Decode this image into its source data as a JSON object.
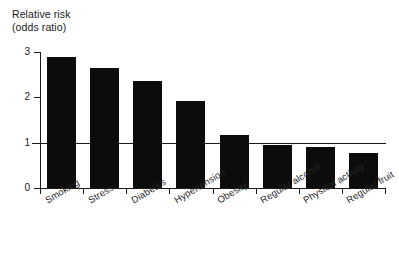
{
  "chart_data": {
    "type": "bar",
    "title": "",
    "ylabel": "Relative risk (odds ratio)",
    "ylabel_lines": [
      "Relative risk",
      "(odds ratio)"
    ],
    "xlabel": "",
    "categories": [
      "Smoking",
      "Stress",
      "Diabetes",
      "Hypertension",
      "Obesity",
      "Regular alcohol",
      "Physical activity",
      "Regular fruit"
    ],
    "values": [
      2.88,
      2.65,
      2.37,
      1.93,
      1.17,
      0.95,
      0.91,
      0.77
    ],
    "ylim": [
      0,
      3
    ],
    "yticks": [
      0,
      1,
      2,
      3
    ],
    "ytick_labels": [
      "0",
      "1",
      "2",
      "3"
    ],
    "grid": false,
    "legend": "none",
    "reference_line": {
      "value": 1,
      "label": ""
    },
    "bar_color": "#0c0c0c",
    "axis_color": "#1a1a1a",
    "background": "#ffffff",
    "xtick_label_rotation": -31
  }
}
